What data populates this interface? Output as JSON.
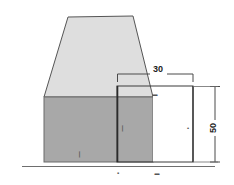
{
  "figure": {
    "background_color": "#ffffff"
  },
  "colors": {
    "top_face_fill": "#dedede",
    "front_face_fill": "#a8a8a8",
    "overlay_fill": "#ffffff",
    "outline": "#555555",
    "dark_outline": "#2b2b2b",
    "dimension_line": "#4a4a4a",
    "text": "#1c1c1c"
  },
  "solid": {
    "top_face_name": "trapezoid-top-face",
    "front_face_name": "rectangle-front-face",
    "trapezoid_points": "44,97 68,17 133,16 153,97",
    "front_rect": {
      "x": 44,
      "y": 97,
      "width": 109,
      "height": 65
    }
  },
  "overlay": {
    "name": "white-measurement-rectangle",
    "rect": {
      "x": 117,
      "y": 86,
      "width": 76,
      "height": 76
    },
    "left_edge_x": 117,
    "right_edge_x": 193,
    "top_edge_y": 86,
    "bottom_edge_y": 162
  },
  "dimensions": {
    "horizontal_top": {
      "label": "30",
      "name": "dimension-30-horizontal",
      "start_x": 117,
      "end_x": 193,
      "line_y": 74,
      "text_x": 158,
      "text_y": 71,
      "font_size": 9
    },
    "vertical_right": {
      "label": "50",
      "name": "dimension-50-vertical",
      "line_x": 215,
      "start_y": 86,
      "end_y": 162,
      "text_x": 216,
      "text_y": 128,
      "font_size": 9,
      "rotation": -90
    },
    "inner_vertical": {
      "label": "•",
      "name": "dimension-inner-vertical-tick",
      "line_x": 193,
      "text_x": 189,
      "text_y": 128,
      "font_size": 5
    }
  },
  "tick_marks": [
    {
      "name": "tick-mark-overlay-top",
      "label": "▬",
      "x": 155,
      "y": 95,
      "font_size": 5
    },
    {
      "name": "tick-mark-front-face",
      "label": "❘",
      "x": 121,
      "y": 128,
      "font_size": 5
    },
    {
      "name": "tick-mark-front-bottom",
      "label": "❘",
      "x": 79,
      "y": 155,
      "font_size": 5
    },
    {
      "name": "tick-mark-bottom-left",
      "label": "▪",
      "x": 118,
      "y": 174,
      "font_size": 5
    },
    {
      "name": "tick-mark-bottom-right",
      "label": "▬",
      "x": 157,
      "y": 174,
      "font_size": 5
    }
  ],
  "baseline": {
    "name": "bottom-baseline",
    "start_x": 22,
    "end_x": 215,
    "y": 167
  }
}
